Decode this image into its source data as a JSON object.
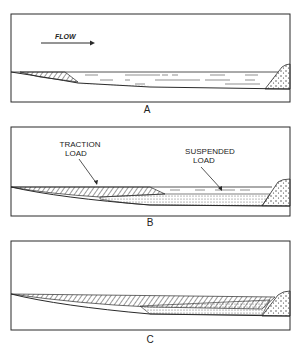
{
  "figure": {
    "panels": [
      {
        "id": "A",
        "label": "A",
        "flow_label": "FLOW"
      },
      {
        "id": "B",
        "label": "B",
        "annotations": {
          "traction_line1": "TRACTION",
          "traction_line2": "LOAD",
          "suspended_line1": "SUSPENDED",
          "suspended_line2": "LOAD"
        }
      },
      {
        "id": "C",
        "label": "C"
      }
    ]
  },
  "colors": {
    "ink": "#2a2a2a",
    "background": "#ffffff"
  }
}
